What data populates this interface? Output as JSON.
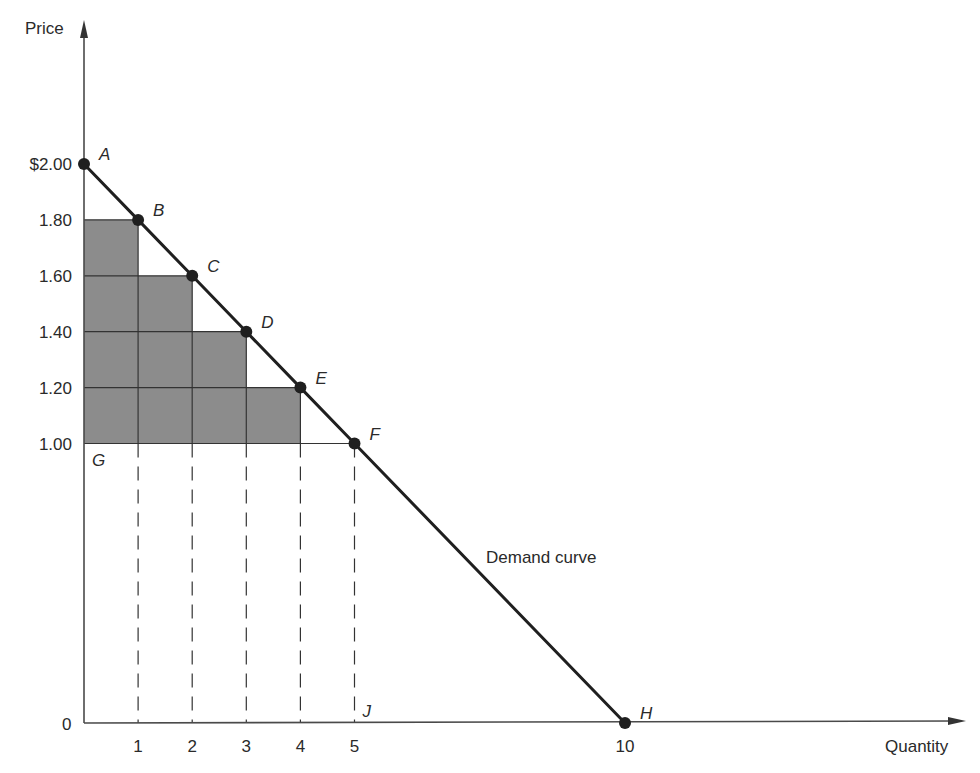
{
  "chart_data": {
    "type": "line",
    "title": "",
    "xlabel": "Quantity",
    "ylabel": "Price",
    "x_ticks": [
      "1",
      "2",
      "3",
      "4",
      "5",
      "10"
    ],
    "y_ticks": [
      "$2.00",
      "1.80",
      "1.60",
      "1.40",
      "1.20",
      "1.00"
    ],
    "origin_label": "0",
    "xlim": [
      0,
      16.5
    ],
    "ylim": [
      0,
      2.6
    ],
    "grid": false,
    "series": [
      {
        "name": "Demand curve",
        "points": [
          {
            "label": "A",
            "q": 0,
            "p": 2.0
          },
          {
            "label": "B",
            "q": 1,
            "p": 1.8
          },
          {
            "label": "C",
            "q": 2,
            "p": 1.6
          },
          {
            "label": "D",
            "q": 3,
            "p": 1.4
          },
          {
            "label": "E",
            "q": 4,
            "p": 1.2
          },
          {
            "label": "F",
            "q": 5,
            "p": 1.0
          },
          {
            "label": "H",
            "q": 10,
            "p": 0.0
          }
        ]
      }
    ],
    "shaded_consumer_surplus_steps": [
      {
        "q_from": 0,
        "q_to": 1,
        "p_top": 1.8,
        "p_bottom": 1.0
      },
      {
        "q_from": 1,
        "q_to": 2,
        "p_top": 1.6,
        "p_bottom": 1.0
      },
      {
        "q_from": 2,
        "q_to": 3,
        "p_top": 1.4,
        "p_bottom": 1.0
      },
      {
        "q_from": 3,
        "q_to": 4,
        "p_top": 1.2,
        "p_bottom": 1.0
      }
    ],
    "reference_points": [
      {
        "label": "G",
        "q": 0,
        "p": 1.0
      },
      {
        "label": "J",
        "q": 5,
        "p": 0
      }
    ],
    "dashed_verticals_at_q": [
      1,
      2,
      3,
      4,
      5
    ],
    "annotations": [
      {
        "text": "Demand curve",
        "q": 7.5,
        "p": 0.6
      }
    ]
  },
  "colors": {
    "line": "#1f1f1f",
    "shade": "#8c8c8c",
    "text": "#2a2a2a",
    "axis": "#4a4a4a"
  }
}
